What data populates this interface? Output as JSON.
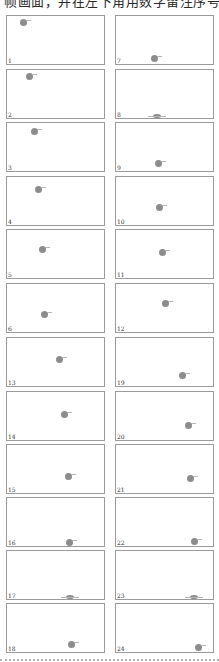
{
  "header": {
    "text": "帧画面，并在左下角用数字留注序号"
  },
  "frames": [
    {
      "label": "1",
      "ball": {
        "x": 16,
        "y": 6,
        "flat": false
      }
    },
    {
      "label": "2",
      "ball": {
        "x": 22,
        "y": 6,
        "flat": false
      }
    },
    {
      "label": "3",
      "ball": {
        "x": 27,
        "y": 8,
        "flat": false
      }
    },
    {
      "label": "4",
      "ball": {
        "x": 31,
        "y": 12,
        "flat": false
      }
    },
    {
      "label": "5",
      "ball": {
        "x": 35,
        "y": 19,
        "flat": false
      }
    },
    {
      "label": "6",
      "ball": {
        "x": 37,
        "y": 30,
        "flat": false
      }
    },
    {
      "label": "7",
      "ball": {
        "x": 38,
        "y": 42,
        "flat": false
      }
    },
    {
      "label": "8",
      "ball": {
        "x": 41,
        "y": 46,
        "flat": true
      }
    },
    {
      "label": "9",
      "ball": {
        "x": 42,
        "y": 40,
        "flat": false
      }
    },
    {
      "label": "10",
      "ball": {
        "x": 43,
        "y": 30,
        "flat": false
      }
    },
    {
      "label": "11",
      "ball": {
        "x": 46,
        "y": 22,
        "flat": false
      }
    },
    {
      "label": "12",
      "ball": {
        "x": 49,
        "y": 19,
        "flat": false
      }
    },
    {
      "label": "13",
      "ball": {
        "x": 52,
        "y": 21,
        "flat": false
      }
    },
    {
      "label": "14",
      "ball": {
        "x": 57,
        "y": 22,
        "flat": false
      }
    },
    {
      "label": "15",
      "ball": {
        "x": 61,
        "y": 31,
        "flat": false
      }
    },
    {
      "label": "16",
      "ball": {
        "x": 62,
        "y": 44,
        "flat": false
      }
    },
    {
      "label": "17",
      "ball": {
        "x": 63,
        "y": 46,
        "flat": true
      }
    },
    {
      "label": "18",
      "ball": {
        "x": 64,
        "y": 40,
        "flat": false
      }
    },
    {
      "label": "19",
      "ball": {
        "x": 66,
        "y": 37,
        "flat": false
      }
    },
    {
      "label": "20",
      "ball": {
        "x": 72,
        "y": 33,
        "flat": false
      }
    },
    {
      "label": "21",
      "ball": {
        "x": 74,
        "y": 33,
        "flat": false
      }
    },
    {
      "label": "22",
      "ball": {
        "x": 78,
        "y": 43,
        "flat": false
      }
    },
    {
      "label": "23",
      "ball": {
        "x": 78,
        "y": 46,
        "flat": true
      }
    },
    {
      "label": "24",
      "ball": {
        "x": 82,
        "y": 43,
        "flat": false
      }
    }
  ],
  "layout": {
    "columns_x": [
      6,
      115
    ],
    "upper_group_rows_y": [
      15,
      69,
      122,
      176,
      229,
      283
    ],
    "lower_group_rows_y": [
      337,
      391,
      444,
      497,
      550,
      603
    ]
  },
  "colors": {
    "ball": "#8c8c8c",
    "frame_border": "#9a9a9a",
    "divider": "#b0b0b0"
  }
}
